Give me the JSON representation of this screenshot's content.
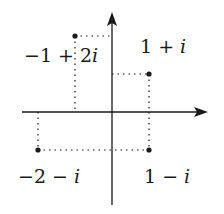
{
  "diagram": {
    "type": "complex-plane",
    "axes": {
      "origin_px": [
        112,
        112
      ],
      "unit_px": 37,
      "x_axis": {
        "from": 22,
        "to": 208,
        "arrow": true
      },
      "y_axis": {
        "from": 205,
        "to": 12,
        "arrow": true
      }
    },
    "points": [
      {
        "id": "p1",
        "re": -1,
        "im": 2,
        "label_real": "−1 + 2",
        "label_imag": "i",
        "label_pos": [
          24,
          62
        ]
      },
      {
        "id": "p2",
        "re": 1,
        "im": 1,
        "label_real": "1 + ",
        "label_imag": "i",
        "label_pos": [
          140,
          53
        ]
      },
      {
        "id": "p3",
        "re": -2,
        "im": -1,
        "label_real": "−2 − ",
        "label_imag": "i",
        "label_pos": [
          18,
          183
        ]
      },
      {
        "id": "p4",
        "re": 1,
        "im": -1,
        "label_real": "1 − ",
        "label_imag": "i",
        "label_pos": [
          144,
          183
        ]
      }
    ],
    "colors": {
      "ink": "#1a1a1a",
      "background": "#ffffff"
    }
  }
}
